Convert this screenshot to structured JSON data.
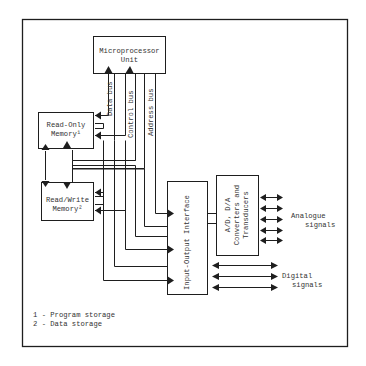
{
  "diagram": {
    "blocks": {
      "mpu": {
        "line1": "Microprocessor",
        "line2": "Unit"
      },
      "rom": {
        "line1": "Read-Only",
        "line2": "Memory¹"
      },
      "ram": {
        "line1": "Read/Write",
        "line2": "Memory²"
      },
      "io": {
        "label": "Input-Output Interface"
      },
      "adc": {
        "line1": "A/D, D/A",
        "line2": "Converters and",
        "line3": "Transducers"
      }
    },
    "buses": {
      "data": "Data bus",
      "control": "Control bus",
      "address": "Address bus"
    },
    "signals": {
      "analogue_line1": "Analogue",
      "analogue_line2": "signals",
      "digital_line1": "Digital",
      "digital_line2": "signals"
    },
    "legend": [
      {
        "text": "1 - Program storage"
      },
      {
        "text": "2 - Data storage"
      }
    ],
    "colors": {
      "line": "#1e1e1e",
      "background": "#ffffff"
    }
  }
}
